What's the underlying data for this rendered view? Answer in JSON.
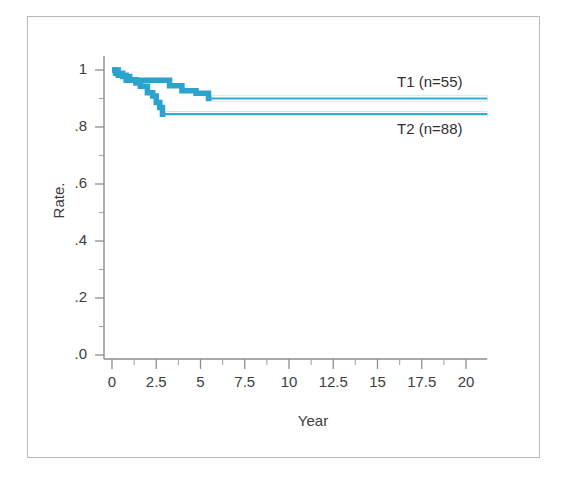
{
  "chart_data": {
    "type": "line",
    "subtype": "kaplan-meier-step",
    "title": "",
    "xlabel": "Year",
    "ylabel": "Rate.",
    "xlim": [
      0,
      21.2
    ],
    "ylim": [
      0,
      1.06
    ],
    "grid": false,
    "legend_position": "right-inline",
    "xticks": [
      0,
      2.5,
      5,
      7.5,
      10,
      12.5,
      15,
      17.5,
      20
    ],
    "xtick_labels": [
      "0",
      "2.5",
      "5",
      "7.5",
      "10",
      "12.5",
      "15",
      "17.5",
      "20"
    ],
    "xminor_ticks": [
      1.25,
      3.75,
      6.25,
      8.75,
      11.25,
      13.75,
      16.25,
      18.75
    ],
    "yticks": [
      0.0,
      0.2,
      0.4,
      0.6,
      0.8,
      1.0
    ],
    "ytick_labels": [
      ".0",
      ".2",
      ".4",
      ".6",
      ".8",
      "1"
    ],
    "yminor_ticks": [
      0.1,
      0.3,
      0.5,
      0.7,
      0.9
    ],
    "line_color": "#35A8D4",
    "step_color": "#2BA3CE",
    "series": [
      {
        "name": "T1 (n=55)",
        "label": "T1 (n=55)",
        "n": 55,
        "color": "#35A8D4",
        "final_rate": 0.9,
        "steps": [
          {
            "x": 0.0,
            "y": 1.0
          },
          {
            "x": 0.3,
            "y": 1.0
          },
          {
            "x": 0.35,
            "y": 0.982
          },
          {
            "x": 0.75,
            "y": 0.982
          },
          {
            "x": 0.8,
            "y": 0.964
          },
          {
            "x": 1.35,
            "y": 0.964
          },
          {
            "x": 1.4,
            "y": 0.964
          },
          {
            "x": 2.0,
            "y": 0.964
          },
          {
            "x": 2.05,
            "y": 0.964
          },
          {
            "x": 2.6,
            "y": 0.964
          },
          {
            "x": 2.65,
            "y": 0.964
          },
          {
            "x": 3.2,
            "y": 0.964
          },
          {
            "x": 3.25,
            "y": 0.945
          },
          {
            "x": 3.9,
            "y": 0.945
          },
          {
            "x": 3.95,
            "y": 0.927
          },
          {
            "x": 4.7,
            "y": 0.927
          },
          {
            "x": 4.75,
            "y": 0.918
          },
          {
            "x": 5.4,
            "y": 0.918
          },
          {
            "x": 5.45,
            "y": 0.9
          },
          {
            "x": 21.2,
            "y": 0.9
          }
        ]
      },
      {
        "name": "T2 (n=88)",
        "label": "T2 (n=88)",
        "n": 88,
        "color": "#35A8D4",
        "final_rate": 0.845,
        "steps": [
          {
            "x": 0.0,
            "y": 1.0
          },
          {
            "x": 0.15,
            "y": 1.0
          },
          {
            "x": 0.2,
            "y": 0.989
          },
          {
            "x": 0.55,
            "y": 0.989
          },
          {
            "x": 0.6,
            "y": 0.977
          },
          {
            "x": 0.95,
            "y": 0.977
          },
          {
            "x": 1.0,
            "y": 0.966
          },
          {
            "x": 1.3,
            "y": 0.966
          },
          {
            "x": 1.35,
            "y": 0.954
          },
          {
            "x": 1.55,
            "y": 0.954
          },
          {
            "x": 1.6,
            "y": 0.943
          },
          {
            "x": 1.95,
            "y": 0.943
          },
          {
            "x": 2.0,
            "y": 0.92
          },
          {
            "x": 2.25,
            "y": 0.92
          },
          {
            "x": 2.3,
            "y": 0.909
          },
          {
            "x": 2.45,
            "y": 0.909
          },
          {
            "x": 2.5,
            "y": 0.886
          },
          {
            "x": 2.65,
            "y": 0.886
          },
          {
            "x": 2.7,
            "y": 0.868
          },
          {
            "x": 2.8,
            "y": 0.868
          },
          {
            "x": 2.85,
            "y": 0.845
          },
          {
            "x": 21.2,
            "y": 0.845
          }
        ]
      }
    ],
    "annotations": [
      {
        "text": "T1 (n=55)",
        "x": 17.8,
        "y": 0.955
      },
      {
        "text": "T2 (n=88)",
        "x": 17.8,
        "y": 0.79
      }
    ]
  },
  "axes": {
    "xlabel": "Year",
    "ylabel": "Rate."
  }
}
